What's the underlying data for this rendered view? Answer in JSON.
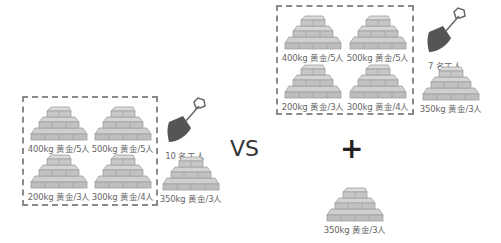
{
  "scenario_a": {
    "group": [
      {
        "label": "400kg 黄金/5人"
      },
      {
        "label": "500kg 黄金/5人"
      },
      {
        "label": "200kg 黄金/3人"
      },
      {
        "label": "300kg 黄金/4人"
      }
    ],
    "workers": {
      "icon": "shovel-icon",
      "label": "10 名工人"
    },
    "extra": {
      "label": "350kg 黄金/3人"
    }
  },
  "vs_label": "VS",
  "scenario_b": {
    "group": [
      {
        "label": "400kg 黄金/5人"
      },
      {
        "label": "500kg 黄金/5人"
      },
      {
        "label": "200kg 黄金/3人"
      },
      {
        "label": "300kg 黄金/4人"
      }
    ],
    "workers": {
      "icon": "shovel-icon",
      "label": "7 名工人"
    },
    "extra": {
      "label": "350kg 黄金/3人"
    }
  },
  "plus_label": "+",
  "added": {
    "label": "350kg 黄金/3人"
  },
  "colors": {
    "pile_fill": "#c8c8c8",
    "pile_stroke": "#9a9a9a",
    "shovel": "#555555",
    "dash": "#8a8a8a"
  }
}
